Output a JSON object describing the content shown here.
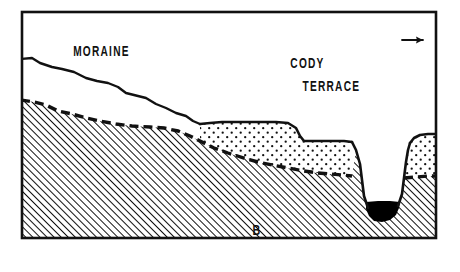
{
  "figure": {
    "kind": "geologic-cross-section",
    "caption_label": "B",
    "frame": {
      "x": 21,
      "y": 11,
      "width": 416,
      "height": 228
    },
    "colors": {
      "ink": "#111111",
      "paper": "#ffffff",
      "water_fill": "#000000",
      "bedrock_hatch": "#111111",
      "terrace_stipple": "#111111"
    }
  },
  "labels": {
    "moraine": "MORAINE",
    "cody": "CODY",
    "terrace": "TERRACE",
    "direction": "NE",
    "direction_arrow": "→",
    "section_id": "B"
  },
  "units": [
    {
      "name": "moraine",
      "label": "MORAINE",
      "fill": "blank",
      "description": "Unornamented body between the moraine surface line and the dashed bedrock contact"
    },
    {
      "name": "cody-terrace-gravel",
      "label": "CODY TERRACE",
      "fill": "stipple",
      "description": "Stippled terrace gravel forming two tread levels and a remnant on the right valley wall"
    },
    {
      "name": "bedrock",
      "label": "",
      "fill": "diagonal-hatch",
      "description": "Diagonally hatched bedrock below the dashed erosional contact"
    },
    {
      "name": "channel-water",
      "label": "",
      "fill": "solid-black",
      "description": "Solid black water in the incised channel at the valley bottom"
    }
  ],
  "annotations": {
    "moraine_label_pos": {
      "x": 60,
      "y": 62
    },
    "cody_label_pos": {
      "x": 238,
      "y": 76
    },
    "terrace_label_pos": {
      "x": 248,
      "y": 102
    },
    "ne_label_pos": {
      "x": 381,
      "y": 44
    },
    "ne_arrow_pos": {
      "x": 410,
      "y": 44
    },
    "section_id_pos": {
      "x": 214,
      "y": 260
    }
  },
  "geometry": {
    "moraine_surface": "M 21,59 L 32,58 L 40,63 L 52,67 L 62,69 L 74,72 L 86,78 L 97,81 L 108,83 L 118,87 L 126,93 L 134,95 L 146,98 L 156,104 L 166,108 L 176,113 L 186,116 L 193,121 L 200,124",
    "bedrock_contact": "M 21,100 L 34,102 L 46,105 L 58,111 L 72,114 L 86,118 L 100,121 L 116,124 L 132,126 L 150,127 L 164,128 L 178,131 L 190,136 L 200,141 L 214,148 L 228,153 L 244,158 L 258,162 L 272,165 L 288,168 L 304,171 L 318,173 L 330,174 L 342,175",
    "terrace_top": "M 200,124 L 210,123 L 222,122 L 240,122 L 258,122 L 276,122 L 288,123 L 296,128 L 300,136 L 304,141 L 316,141 L 330,141 L 344,141 L 352,142",
    "channel_left_wall": "M 352,142 L 356,150 L 360,164 L 362,180 L 364,196 L 368,206",
    "channel_right_wall": "M 398,206 L 402,194 L 404,178 L 406,162 L 408,150 L 410,143",
    "right_terrace_top": "M 410,143 L 414,138 L 420,135 L 428,134 L 437,134",
    "right_terrace_base": "M 404,178 L 416,177 L 428,176 L 437,176",
    "water_surface": "M 366,202 L 378,201 L 390,201 L 400,202"
  }
}
